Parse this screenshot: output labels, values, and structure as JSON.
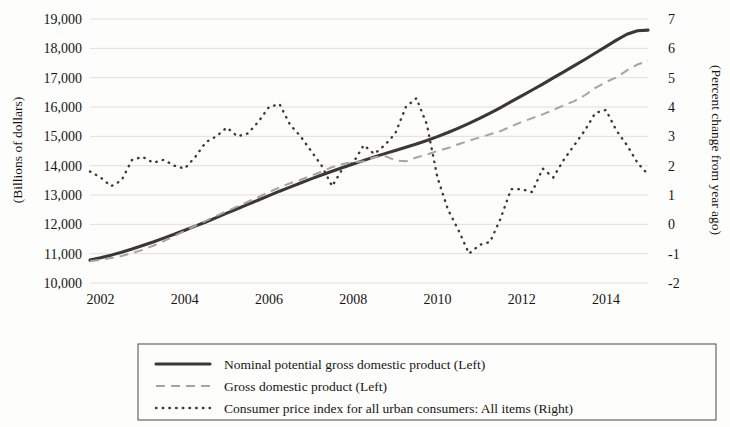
{
  "chart_data": {
    "type": "line",
    "title": "",
    "xlabel": "",
    "ylabel": "(Billions of dollars)",
    "y2label": "(Percent change from year ago)",
    "xlim": [
      2001.75,
      2015.0
    ],
    "ylim": [
      10000,
      19000
    ],
    "y2lim": [
      -2,
      7
    ],
    "grid": true,
    "legend_position": "bottom",
    "x_ticks": [
      "2002",
      "2004",
      "2006",
      "2008",
      "2010",
      "2012",
      "2014"
    ],
    "x_tick_values": [
      2002,
      2004,
      2006,
      2008,
      2010,
      2012,
      2014
    ],
    "y_ticks": [
      "10,000",
      "11,000",
      "12,000",
      "13,000",
      "14,000",
      "15,000",
      "16,000",
      "17,000",
      "18,000",
      "19,000"
    ],
    "y_tick_values": [
      10000,
      11000,
      12000,
      13000,
      14000,
      15000,
      16000,
      17000,
      18000,
      19000
    ],
    "y2_ticks": [
      "-2",
      "-1",
      "0",
      "1",
      "2",
      "3",
      "4",
      "5",
      "6",
      "7"
    ],
    "y2_tick_values": [
      -2,
      -1,
      0,
      1,
      2,
      3,
      4,
      5,
      6,
      7
    ],
    "series": [
      {
        "name": "Nominal potential gross domestic product (Left)",
        "axis": "left",
        "style": "solid",
        "color": "#3a3834",
        "x": [
          2001.75,
          2002.0,
          2002.25,
          2002.5,
          2002.75,
          2003.0,
          2003.25,
          2003.5,
          2003.75,
          2004.0,
          2004.25,
          2004.5,
          2004.75,
          2005.0,
          2005.25,
          2005.5,
          2005.75,
          2006.0,
          2006.25,
          2006.5,
          2006.75,
          2007.0,
          2007.25,
          2007.5,
          2007.75,
          2008.0,
          2008.25,
          2008.5,
          2008.75,
          2009.0,
          2009.25,
          2009.5,
          2009.75,
          2010.0,
          2010.25,
          2010.5,
          2010.75,
          2011.0,
          2011.25,
          2011.5,
          2011.75,
          2012.0,
          2012.25,
          2012.5,
          2012.75,
          2013.0,
          2013.25,
          2013.5,
          2013.75,
          2014.0,
          2014.25,
          2014.5,
          2014.75,
          2015.0
        ],
        "values": [
          10780,
          10860,
          10950,
          11050,
          11160,
          11280,
          11400,
          11530,
          11660,
          11800,
          11940,
          12080,
          12230,
          12380,
          12530,
          12680,
          12830,
          12980,
          13130,
          13270,
          13410,
          13550,
          13680,
          13810,
          13940,
          14060,
          14180,
          14300,
          14410,
          14520,
          14630,
          14740,
          14860,
          14990,
          15130,
          15280,
          15440,
          15610,
          15790,
          15980,
          16180,
          16380,
          16580,
          16780,
          16990,
          17200,
          17410,
          17620,
          17840,
          18060,
          18280,
          18480,
          18600,
          18620
        ]
      },
      {
        "name": "Gross domestic product (Left)",
        "axis": "left",
        "style": "dashed",
        "color": "#a6a49e",
        "x": [
          2001.75,
          2002.0,
          2002.25,
          2002.5,
          2002.75,
          2003.0,
          2003.25,
          2003.5,
          2003.75,
          2004.0,
          2004.25,
          2004.5,
          2004.75,
          2005.0,
          2005.25,
          2005.5,
          2005.75,
          2006.0,
          2006.25,
          2006.5,
          2006.75,
          2007.0,
          2007.25,
          2007.5,
          2007.75,
          2008.0,
          2008.25,
          2008.5,
          2008.75,
          2009.0,
          2009.25,
          2009.5,
          2009.75,
          2010.0,
          2010.25,
          2010.5,
          2010.75,
          2011.0,
          2011.25,
          2011.5,
          2011.75,
          2012.0,
          2012.25,
          2012.5,
          2012.75,
          2013.0,
          2013.25,
          2013.5,
          2013.75,
          2014.0,
          2014.25,
          2014.5,
          2014.75,
          2015.0
        ],
        "values": [
          10740,
          10790,
          10850,
          10920,
          11020,
          11130,
          11270,
          11430,
          11600,
          11780,
          11950,
          12120,
          12290,
          12450,
          12610,
          12770,
          12930,
          13100,
          13260,
          13400,
          13520,
          13650,
          13800,
          13950,
          14060,
          14120,
          14150,
          14290,
          14330,
          14180,
          14150,
          14280,
          14380,
          14500,
          14600,
          14730,
          14850,
          14960,
          15070,
          15180,
          15340,
          15490,
          15620,
          15750,
          15900,
          16060,
          16200,
          16400,
          16650,
          16850,
          17010,
          17250,
          17450,
          17570
        ]
      },
      {
        "name": "Consumer price index for all urban consumers: All items (Right)",
        "axis": "right",
        "style": "dotted",
        "color": "#3c3a36",
        "x": [
          2001.75,
          2002.0,
          2002.25,
          2002.5,
          2002.75,
          2003.0,
          2003.25,
          2003.5,
          2003.75,
          2004.0,
          2004.25,
          2004.5,
          2004.75,
          2005.0,
          2005.25,
          2005.5,
          2005.75,
          2006.0,
          2006.25,
          2006.5,
          2006.75,
          2007.0,
          2007.25,
          2007.5,
          2007.75,
          2008.0,
          2008.25,
          2008.5,
          2008.75,
          2009.0,
          2009.25,
          2009.5,
          2009.75,
          2010.0,
          2010.25,
          2010.5,
          2010.75,
          2011.0,
          2011.25,
          2011.5,
          2011.75,
          2012.0,
          2012.25,
          2012.5,
          2012.75,
          2013.0,
          2013.25,
          2013.5,
          2013.75,
          2014.0,
          2014.25,
          2014.5,
          2014.75,
          2015.0
        ],
        "values": [
          1.8,
          1.6,
          1.3,
          1.5,
          2.2,
          2.3,
          2.1,
          2.2,
          2.0,
          1.9,
          2.3,
          2.8,
          3.0,
          3.3,
          3.0,
          3.1,
          3.5,
          4.0,
          4.1,
          3.4,
          3.0,
          2.5,
          2.0,
          1.3,
          1.9,
          2.1,
          2.7,
          2.4,
          2.7,
          3.1,
          4.0,
          4.3,
          3.4,
          1.6,
          0.5,
          -0.2,
          -1.0,
          -0.7,
          -0.6,
          0.2,
          1.2,
          1.2,
          1.1,
          1.9,
          1.6,
          2.2,
          2.7,
          3.2,
          3.8,
          3.9,
          3.2,
          2.7,
          2.1,
          1.7
        ]
      }
    ],
    "cpi_x2": [
      2012.0,
      2012.25,
      2012.5,
      2012.75,
      2013.0,
      2013.25,
      2013.5,
      2013.75,
      2014.0,
      2014.25,
      2014.5,
      2014.75,
      2015.0
    ],
    "cpi_v2": [
      2.3,
      1.9,
      1.7,
      1.8,
      1.6,
      1.4,
      1.4,
      1.5,
      1.6,
      1.8,
      1.7,
      1.7,
      1.6
    ]
  },
  "legend": {
    "items": [
      {
        "label": "Nominal potential gross domestic product (Left)",
        "style": "solid"
      },
      {
        "label": "Gross domestic product (Left)",
        "style": "dashed"
      },
      {
        "label": "Consumer price index for all urban consumers: All items (Right)",
        "style": "dotted"
      }
    ]
  }
}
